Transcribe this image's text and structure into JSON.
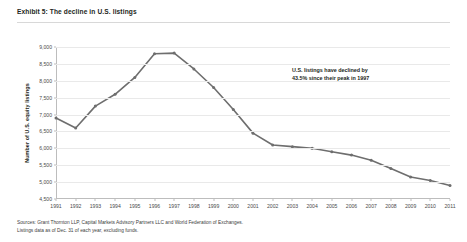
{
  "exhibit": {
    "title": "Exhibit 5: The decline in U.S. listings"
  },
  "annotation": {
    "text": "U.S. listings have declined by\n43.5% since their peak in 1997"
  },
  "footnotes": {
    "line1": "Sources: Grant Thornton LLP, Capital Markets Advisory Partners LLC and World Federation of Exchanges.",
    "line2": "Listings data as of Dec. 31 of each year, excluding funds."
  },
  "colors": {
    "series": "#6e6e6e",
    "grid": "#e9e9e9",
    "axis": "#bdbdbd",
    "text": "#231f20"
  },
  "chart_data": {
    "type": "line",
    "title": "Exhibit 5: The decline in U.S. listings",
    "xlabel": "",
    "ylabel": "Number of U.S. equity listings",
    "ylim": [
      4500,
      9000
    ],
    "ytick_step": 500,
    "yticks": [
      "9,000",
      "8,500",
      "8,000",
      "7,500",
      "7,000",
      "6,500",
      "6,000",
      "5,500",
      "5,000",
      "4,500"
    ],
    "ytick_values": [
      9000,
      8500,
      8000,
      7500,
      7000,
      6500,
      6000,
      5500,
      5000,
      4500
    ],
    "grid": true,
    "legend": "none",
    "categories": [
      "1991",
      "1992",
      "1993",
      "1994",
      "1995",
      "1996",
      "1997",
      "1998",
      "1999",
      "2000",
      "2001",
      "2002",
      "2003",
      "2004",
      "2005",
      "2006",
      "2007",
      "2008",
      "2009",
      "2010",
      "2011"
    ],
    "values": [
      6900,
      6600,
      7250,
      7600,
      8100,
      8800,
      8820,
      8350,
      7800,
      7150,
      6450,
      6100,
      6050,
      6000,
      5900,
      5800,
      5650,
      5400,
      5150,
      5050,
      4900
    ],
    "markers": true,
    "annotations": [
      {
        "text": "U.S. listings have declined by 43.5% since their peak in 1997",
        "peak_year": "1997",
        "decline_pct": "43.5%"
      }
    ]
  }
}
